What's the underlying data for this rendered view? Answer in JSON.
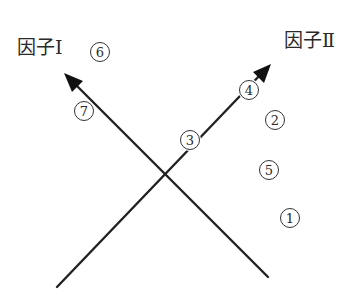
{
  "diagram": {
    "type": "factor-loading-plot",
    "colors": {
      "line": "#222222",
      "text": "#2a2a2a",
      "background": "#ffffff"
    },
    "axes": [
      {
        "id": "factor1",
        "label": "因子Ⅰ",
        "direction": "upper-left",
        "from": [
          268,
          277
        ],
        "to": [
          64,
          73
        ]
      },
      {
        "id": "factor2",
        "label": "因子Ⅱ",
        "direction": "upper-right",
        "from": [
          57,
          287
        ],
        "to": [
          271,
          64
        ]
      }
    ],
    "items": [
      {
        "number": "1",
        "glyph": "①",
        "x": 290,
        "y": 218
      },
      {
        "number": "2",
        "glyph": "②",
        "x": 275,
        "y": 120
      },
      {
        "number": "3",
        "glyph": "③",
        "x": 190,
        "y": 140
      },
      {
        "number": "4",
        "glyph": "④",
        "x": 249,
        "y": 90
      },
      {
        "number": "5",
        "glyph": "⑤",
        "x": 269,
        "y": 170
      },
      {
        "number": "6",
        "glyph": "⑥",
        "x": 100,
        "y": 52
      },
      {
        "number": "7",
        "glyph": "⑦",
        "x": 84,
        "y": 111
      }
    ]
  }
}
